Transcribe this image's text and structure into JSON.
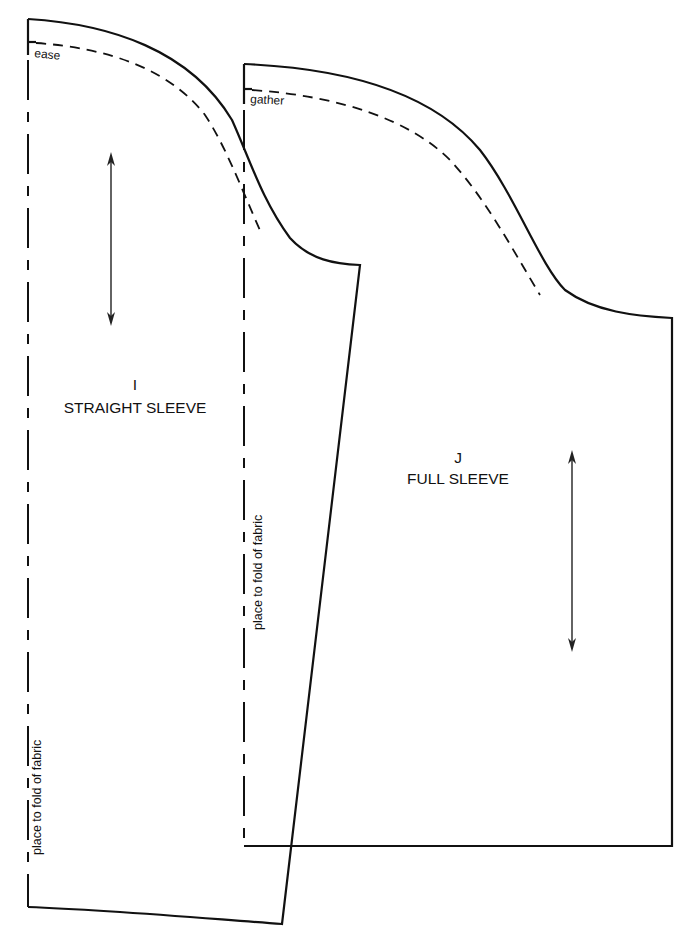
{
  "pieces": [
    {
      "id": "I",
      "name": "STRAIGHT SLEEVE",
      "seam_note": "ease",
      "fold_note": "place to fold of fabric"
    },
    {
      "id": "J",
      "name": "FULL SLEEVE",
      "seam_note": "gather",
      "fold_note": "place to fold of fabric"
    }
  ],
  "colors": {
    "line": "#111111",
    "background": "#ffffff"
  }
}
